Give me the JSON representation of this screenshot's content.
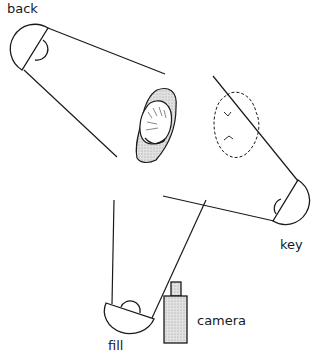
{
  "diagram": {
    "type": "three-point lighting setup (top view)",
    "labels": {
      "back": "back",
      "key": "key",
      "fill": "fill",
      "camera": "camera"
    },
    "elements": [
      {
        "id": "back-light",
        "label": "back"
      },
      {
        "id": "key-light",
        "label": "key"
      },
      {
        "id": "fill-light",
        "label": "fill"
      },
      {
        "id": "camera",
        "label": "camera"
      },
      {
        "id": "subject",
        "label": ""
      },
      {
        "id": "subject-shadow",
        "label": ""
      }
    ],
    "colors": {
      "line": "#1a1a1a",
      "fill_gray": "#d8d8d8",
      "background": "#ffffff"
    }
  }
}
